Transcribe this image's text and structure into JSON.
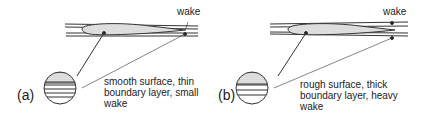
{
  "panels": [
    {
      "id": "a",
      "label": "(a)",
      "wake_label": "wake",
      "caption_lines": [
        "smooth surface, thin",
        "boundary layer, small",
        "wake"
      ]
    },
    {
      "id": "b",
      "label": "(b)",
      "wake_label": "wake",
      "caption_lines": [
        "rough surface, thick",
        "boundary layer, heavy",
        "wake"
      ]
    }
  ]
}
